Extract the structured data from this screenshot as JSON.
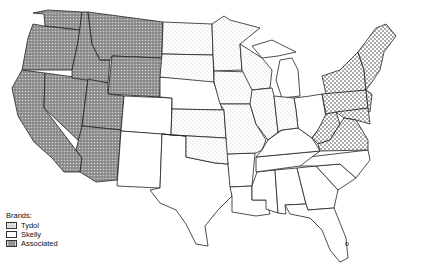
{
  "legend": {
    "title": "Brands:",
    "items": [
      {
        "label": "Tydol",
        "pattern": "dense-dots"
      },
      {
        "label": "Skelly",
        "pattern": "light-dots"
      },
      {
        "label": "Associated",
        "pattern": "dark-crosshatch"
      }
    ]
  },
  "colors": {
    "stroke": "#222222",
    "background": "#ffffff",
    "associated_fill": "#7a7a7a",
    "skelly_dot": "#9a9a9a",
    "tydol_dot": "#333333"
  },
  "regions": {
    "associated": [
      "Washington",
      "Oregon",
      "California",
      "Idaho",
      "Nevada",
      "Montana",
      "Wyoming",
      "Utah",
      "Arizona"
    ],
    "skelly": [
      "North Dakota",
      "South Dakota",
      "Minnesota",
      "Iowa",
      "Wisconsin",
      "Kansas",
      "Missouri",
      "Oklahoma",
      "Illinois",
      "Indiana"
    ],
    "tydol": [
      "Maine",
      "New Hampshire",
      "Vermont",
      "Massachusetts",
      "Rhode Island",
      "Connecticut",
      "New York",
      "New Jersey",
      "Pennsylvania",
      "Delaware",
      "Maryland",
      "Virginia",
      "West Virginia"
    ],
    "unshaded": [
      "Colorado",
      "New Mexico",
      "Nebraska",
      "Texas",
      "Louisiana",
      "Arkansas",
      "Mississippi",
      "Alabama",
      "Georgia",
      "Florida",
      "South Carolina",
      "North Carolina",
      "Tennessee",
      "Kentucky",
      "Ohio",
      "Michigan"
    ]
  }
}
